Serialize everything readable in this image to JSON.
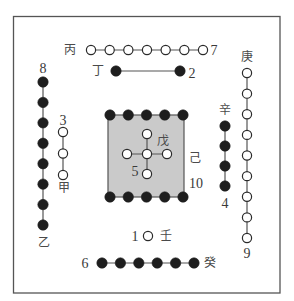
{
  "diagram": {
    "name": "Hetu (River Map) with Heavenly Stems",
    "colors": {
      "background": "#ffffff",
      "frame": "#555555",
      "yang_fill": "#ffffff",
      "yin_fill": "#1e1e1e",
      "dot_stroke": "#2a2a2a",
      "connector": "#555555",
      "center_fill": "#cacaca"
    },
    "groups": {
      "top_outer": {
        "stem": "丙",
        "number": "7",
        "count": 7,
        "type": "yang",
        "direction": "south-outer"
      },
      "top_inner": {
        "stem": "丁",
        "number": "2",
        "count": 2,
        "type": "yin",
        "direction": "south-inner"
      },
      "left_outer": {
        "stem": "乙",
        "number": "8",
        "count": 8,
        "type": "yin",
        "direction": "east-outer"
      },
      "left_inner": {
        "stem": "甲",
        "number": "3",
        "count": 3,
        "type": "yang",
        "direction": "east-inner"
      },
      "right_outer": {
        "stem": "庚",
        "number": "9",
        "count": 9,
        "type": "yang",
        "direction": "west-outer"
      },
      "right_inner": {
        "stem": "辛",
        "number": "4",
        "count": 4,
        "type": "yin",
        "direction": "west-inner"
      },
      "bottom_inner": {
        "stem": "壬",
        "number": "1",
        "count": 1,
        "type": "yang",
        "direction": "north-inner"
      },
      "bottom_outer": {
        "stem": "癸",
        "number": "6",
        "count": 6,
        "type": "yin",
        "direction": "north-outer"
      },
      "center": {
        "stem": "戊",
        "number": "5",
        "count": 5,
        "type": "yang",
        "direction": "center-inner"
      },
      "center_outer": {
        "stem": "己",
        "number": "10",
        "count": 10,
        "type": "yin",
        "direction": "center-outer"
      }
    }
  }
}
